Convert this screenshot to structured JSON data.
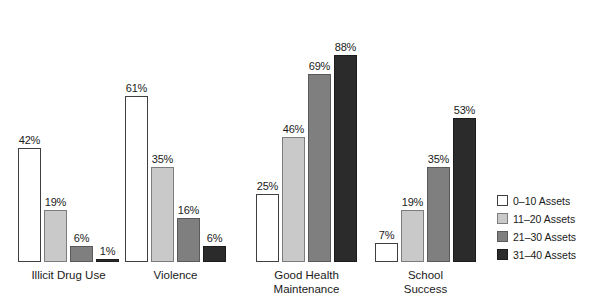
{
  "chart_data": {
    "type": "bar",
    "title": "",
    "subtitle": "",
    "xlabel": "",
    "ylabel": "",
    "ylim": [
      0,
      100
    ],
    "grid": false,
    "value_suffix": "%",
    "legend_position": "right",
    "categories": [
      "Illicit Drug Use",
      "Violence",
      "Good Health\nMaintenance",
      "School\nSuccess"
    ],
    "series": [
      {
        "name": "0–10 Assets",
        "color": "#ffffff",
        "values": [
          42,
          61,
          25,
          7
        ],
        "labels": [
          "42%",
          "61%",
          "25%",
          "7%"
        ]
      },
      {
        "name": "11–20 Assets",
        "color": "#c9c9c9",
        "values": [
          19,
          35,
          46,
          19
        ],
        "labels": [
          "19%",
          "35%",
          "46%",
          "19%"
        ]
      },
      {
        "name": "21–30 Assets",
        "color": "#7f7f7f",
        "values": [
          6,
          16,
          69,
          35
        ],
        "labels": [
          "6%",
          "16%",
          "69%",
          "35%"
        ]
      },
      {
        "name": "31–40 Assets",
        "color": "#2b2b2b",
        "values": [
          1,
          6,
          88,
          53
        ],
        "labels": [
          "1%",
          "6%",
          "88%",
          "53%"
        ]
      }
    ]
  },
  "legend": {
    "items": [
      {
        "label": "0–10 Assets",
        "color": "#ffffff"
      },
      {
        "label": "11–20 Assets",
        "color": "#c9c9c9"
      },
      {
        "label": "21–30 Assets",
        "color": "#7f7f7f"
      },
      {
        "label": "31–40 Assets",
        "color": "#2b2b2b"
      }
    ]
  },
  "layout": {
    "group_left_px": [
      18,
      125,
      256,
      375
    ],
    "baseline_y_px": 262,
    "px_per_percent": 2.72,
    "bar_width_px": 23,
    "bar_gap_px": 3
  }
}
